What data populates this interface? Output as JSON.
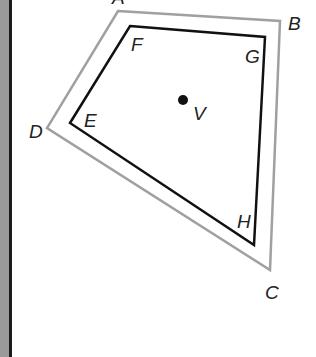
{
  "figure": {
    "outer_quadrilateral": {
      "color": "#9e9e9e",
      "vertices": [
        {
          "label": "A",
          "x": 118,
          "y": 11
        },
        {
          "label": "B",
          "x": 280,
          "y": 21
        },
        {
          "label": "C",
          "x": 270,
          "y": 270
        },
        {
          "label": "D",
          "x": 47,
          "y": 128
        }
      ]
    },
    "inner_quadrilateral": {
      "color": "#111111",
      "vertices": [
        {
          "label": "F",
          "x": 130,
          "y": 26
        },
        {
          "label": "G",
          "x": 265,
          "y": 37
        },
        {
          "label": "H",
          "x": 254,
          "y": 245
        },
        {
          "label": "E",
          "x": 70,
          "y": 123
        }
      ]
    },
    "center_point": {
      "label": "V",
      "x": 183,
      "y": 100
    }
  },
  "labels": {
    "A": "A",
    "B": "B",
    "C": "C",
    "D": "D",
    "E": "E",
    "F": "F",
    "G": "G",
    "H": "H",
    "V": "V"
  }
}
